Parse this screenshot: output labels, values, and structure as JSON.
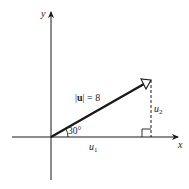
{
  "diagram": {
    "axes": {
      "x_label": "x",
      "y_label": "y"
    },
    "vector": {
      "magnitude_label": "|u| = 8",
      "magnitude_prefix": "|",
      "magnitude_symbol": "u",
      "magnitude_suffix": "| = 8",
      "magnitude": 8,
      "angle_deg": 30,
      "angle_label": "30°"
    },
    "components": {
      "horizontal_label": "u",
      "horizontal_sub": "1",
      "vertical_label": "u",
      "vertical_sub": "2"
    },
    "colors": {
      "line": "#1a1a1a",
      "text": "#222222",
      "background": "#ffffff"
    }
  }
}
